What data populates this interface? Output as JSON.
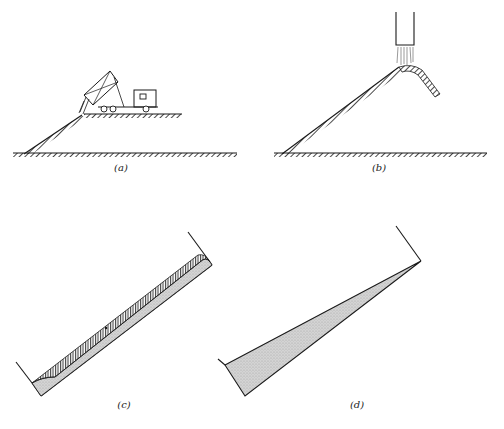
{
  "panels": [
    {
      "id": "a",
      "caption": "(a)",
      "description": "Dump truck tipping fill over edge of embankment; material slides down slope"
    },
    {
      "id": "b",
      "caption": "(b)",
      "description": "Material discharged from chute forming conical pile with slopes on both sides"
    },
    {
      "id": "c",
      "caption": "(c)",
      "description": "Inclined container with thin layer of stratified material along sloped bottom"
    },
    {
      "id": "d",
      "caption": "(d)",
      "description": "Inclined container with wedge of material thickening toward lower end"
    }
  ],
  "colors": {
    "ink": "#1a1a1a",
    "fill_gray": "#cfcfcf",
    "background": "#ffffff"
  }
}
